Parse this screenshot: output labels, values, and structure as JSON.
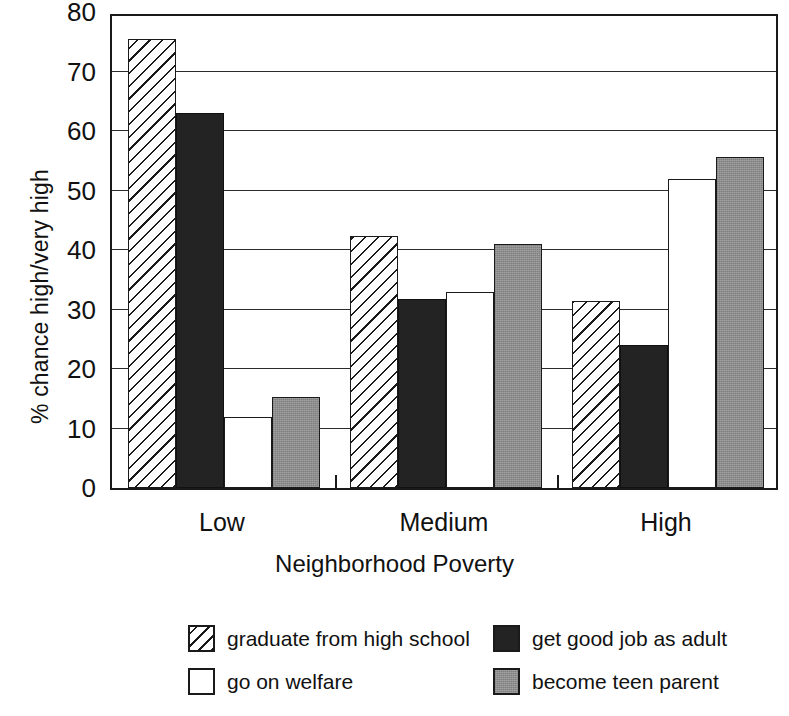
{
  "chart_data": {
    "type": "bar",
    "title": "",
    "xlabel": "Neighborhood Poverty",
    "ylabel": "% chance high/very high",
    "categories": [
      "Low",
      "Medium",
      "High"
    ],
    "ylim": [
      0,
      80
    ],
    "yticks": [
      0,
      10,
      20,
      30,
      40,
      50,
      60,
      70,
      80
    ],
    "ytick_labels": [
      "0",
      "10",
      "20",
      "30",
      "40",
      "50",
      "60",
      "70",
      "80"
    ],
    "grid": true,
    "grid_axis": "y",
    "legend_position": "below",
    "series": [
      {
        "name": "graduate from high school",
        "fill": "hatch",
        "color": "#ffffff",
        "values": [
          75.5,
          42.3,
          31.5
        ]
      },
      {
        "name": "get good job as adult",
        "fill": "solid",
        "color": "#232323",
        "values": [
          63.0,
          31.8,
          24.0
        ]
      },
      {
        "name": "go on welfare",
        "fill": "solid",
        "color": "#ffffff",
        "values": [
          12.0,
          33.0,
          52.0
        ]
      },
      {
        "name": "become teen parent",
        "fill": "solid",
        "color": "#8d8d8d",
        "values": [
          15.3,
          41.0,
          55.7
        ]
      }
    ]
  },
  "axes": {
    "y_title": "% chance high/very high",
    "x_title": "Neighborhood Poverty",
    "y_labels": [
      "80",
      "70",
      "60",
      "50",
      "40",
      "30",
      "20",
      "10",
      "0"
    ],
    "x_labels": [
      "Low",
      "Medium",
      "High"
    ]
  },
  "legend": {
    "entries": [
      {
        "label": "graduate from high school",
        "swatch": "hatch"
      },
      {
        "label": "get good job as adult",
        "swatch": "black"
      },
      {
        "label": "go on welfare",
        "swatch": "white"
      },
      {
        "label": "become teen parent",
        "swatch": "gray"
      }
    ]
  },
  "colors": {
    "axis": "#1a1a1a",
    "grid": "#2b2b2b",
    "black_series": "#232323",
    "gray_series": "#8d8d8d",
    "white_series": "#ffffff",
    "background": "#ffffff"
  }
}
